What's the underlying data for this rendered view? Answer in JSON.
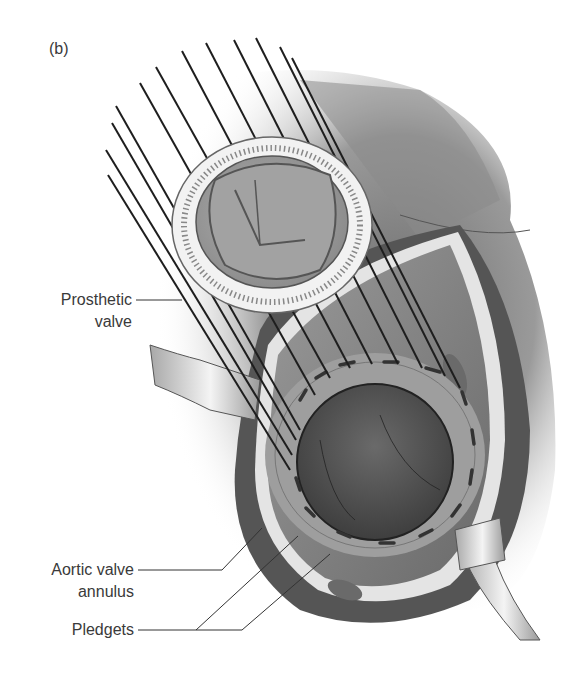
{
  "figure": {
    "panel_label": "(b)",
    "colors": {
      "background": "#ffffff",
      "tissue_dark": "#5a5a5a",
      "tissue_mid": "#8c8c8c",
      "tissue_light": "#b8b8b8",
      "suture": "#1e1e1e",
      "label_text": "#3a3a3a",
      "leader_line": "#333333"
    },
    "labels": [
      {
        "id": "prosthetic-valve",
        "lines": [
          "Prosthetic",
          "valve"
        ]
      },
      {
        "id": "aortic-valve-annulus",
        "lines": [
          "Aortic valve",
          "annulus"
        ]
      },
      {
        "id": "pledgets",
        "lines": [
          "Pledgets"
        ]
      }
    ]
  }
}
